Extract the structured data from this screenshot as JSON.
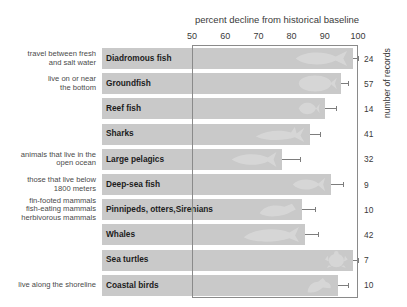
{
  "chart_data": {
    "type": "bar",
    "orientation": "horizontal",
    "title": "percent decline from historical baseline",
    "xlabel": "percent decline from historical baseline",
    "ylabel": "number of records",
    "xlim": [
      50,
      100
    ],
    "xticks": [
      50,
      60,
      70,
      80,
      90,
      100
    ],
    "grid": false,
    "legend": "none",
    "categories": [
      "Diadromous fish",
      "Groundfish",
      "Reef fish",
      "Sharks",
      "Large pelagics",
      "Deep-sea fish",
      "Pinnipeds, otters,\nSirenians",
      "Whales",
      "Sea turtles",
      "Coastal birds"
    ],
    "values": [
      98.5,
      95.0,
      90.0,
      85.5,
      77.0,
      92.0,
      83.0,
      84.0,
      98.5,
      94.0
    ],
    "error_high": [
      100.0,
      97.0,
      93.5,
      88.5,
      82.5,
      95.5,
      87.0,
      88.0,
      100.0,
      97.0
    ],
    "records": [
      24,
      57,
      14,
      41,
      32,
      9,
      10,
      42,
      7,
      10
    ],
    "records_label": "number of records",
    "annotations": [
      "travel between fresh\nand salt water",
      "live on or near\nthe bottom",
      "",
      "",
      "animals that live in the\nopen ocean",
      "those that live below\n1800 meters",
      "fin-footed mammals\nfish-eating mammals\nherbivorous mammals",
      "",
      "",
      "live along the shoreline"
    ],
    "icons": [
      "diadromous-fish-icon",
      "groundfish-icon",
      "reef-fish-icon",
      "shark-icon",
      "large-pelagic-fish-icon",
      "deep-sea-fish-icon",
      "seal-icon",
      "whale-icon",
      "sea-turtle-icon",
      "coastal-bird-icon"
    ],
    "colors": {
      "bar": "#c9c9c9",
      "frame": "#8a8a8a",
      "error": "#7d7d7d",
      "text": "#2b2b2b",
      "background": "#ffffff"
    }
  }
}
